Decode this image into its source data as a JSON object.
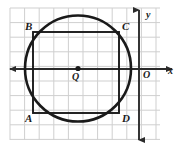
{
  "figure": {
    "background_color": "#ffffff",
    "grid": {
      "color": "#cfcfcf",
      "cell_size": 14.6,
      "left": 10,
      "top": 8,
      "right": 160,
      "bottom": 140,
      "columns": 10,
      "rows": 9,
      "visible": true
    },
    "axes": {
      "stroke_color": "#2b2b2b",
      "x_axis": {
        "label": "x",
        "label_x": 168,
        "label_y": 74,
        "y_position": 69,
        "x_start": 10,
        "x_end": 172,
        "arrow_both_ends": true
      },
      "y_axis": {
        "label": "y",
        "label_x": 146,
        "label_y": 18,
        "x_position": 139,
        "y_start": 10,
        "y_end": 140,
        "arrow_both_ends": true
      },
      "origin": {
        "label": "O",
        "label_x": 143,
        "label_y": 78
      }
    },
    "circle": {
      "center_label": "Q",
      "center_label_x": 72,
      "center_label_y": 80,
      "center_x": 78,
      "center_y": 68.5,
      "radius": 53,
      "stroke_color": "#1a1a1a",
      "stroke_width": 2.6,
      "fill": "none",
      "center_dot_radius": 2.6,
      "center_dot_color": "#1a1a1a"
    },
    "square": {
      "name": "ABCD",
      "stroke_color": "#1a1a1a",
      "stroke_width": 1.9,
      "fill": "none",
      "left": 33,
      "top": 32,
      "right": 119,
      "bottom": 113,
      "vertices": [
        {
          "label": "A",
          "x": 33,
          "y": 113,
          "label_x": 25,
          "label_y": 122
        },
        {
          "label": "B",
          "x": 33,
          "y": 32,
          "label_x": 25,
          "label_y": 30
        },
        {
          "label": "C",
          "x": 119,
          "y": 32,
          "label_x": 122,
          "label_y": 30
        },
        {
          "label": "D",
          "x": 119,
          "y": 113,
          "label_x": 122,
          "label_y": 122
        }
      ]
    }
  }
}
